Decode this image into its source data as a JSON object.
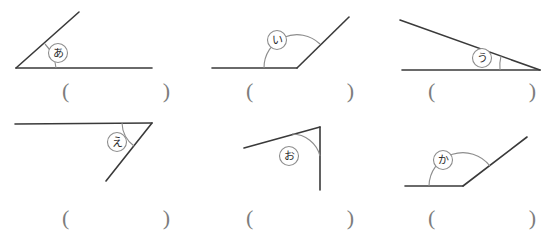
{
  "worksheet": {
    "title": "Angle measurement worksheet",
    "line_color": "#3a3a3a",
    "arc_color": "#8d8d8d",
    "paren_color": "#7d7d7d",
    "background": "#ffffff",
    "paren_open": "(",
    "paren_close": ")"
  },
  "problems": [
    {
      "id": "problem-a",
      "label": "あ",
      "description": "acute angle opening right from bottom-left vertex",
      "answer_placeholder": ""
    },
    {
      "id": "problem-i",
      "label": "い",
      "description": "obtuse angle at bottom vertex between leftward horizontal ray and up-right ray",
      "answer_placeholder": ""
    },
    {
      "id": "problem-u",
      "label": "う",
      "description": "narrow acute angle at right vertex between leftward horizontal ray and up-left slanted ray",
      "answer_placeholder": ""
    },
    {
      "id": "problem-e",
      "label": "え",
      "description": "acute angle at right vertex between leftward horizontal ray and down-left ray",
      "answer_placeholder": ""
    },
    {
      "id": "problem-o",
      "label": "お",
      "description": "acute angle at top-right vertex between down-left ray and downward vertical ray",
      "answer_placeholder": ""
    },
    {
      "id": "problem-ka",
      "label": "か",
      "description": "obtuse angle at bottom vertex between leftward horizontal ray and up-right ray",
      "answer_placeholder": ""
    }
  ]
}
